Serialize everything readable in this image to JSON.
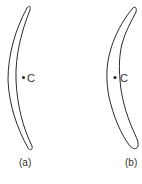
{
  "figures": [
    {
      "id": "a",
      "caption": "(a)",
      "point_label": "C"
    },
    {
      "id": "b",
      "caption": "(b)",
      "point_label": "C"
    }
  ],
  "colors": {
    "stroke": "#2a2a2a",
    "text": "#333333",
    "background": "#ffffff"
  }
}
